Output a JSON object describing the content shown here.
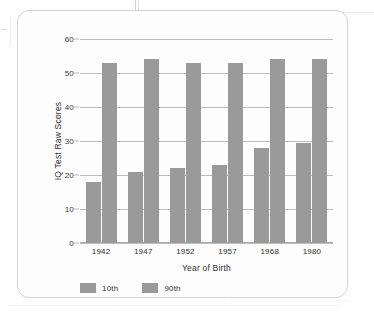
{
  "chart_data": {
    "type": "bar",
    "title": "",
    "xlabel": "Year of Birth",
    "ylabel": "IQ Test Raw Scores",
    "categories": [
      "1942",
      "1947",
      "1952",
      "1957",
      "1968",
      "1980"
    ],
    "series": [
      {
        "name": "10th",
        "values": [
          18,
          21,
          22,
          23,
          28,
          29.5
        ],
        "color": "#9a9a9a"
      },
      {
        "name": "90th",
        "values": [
          53,
          54,
          53,
          53,
          54,
          54
        ],
        "color": "#9a9a9a"
      }
    ],
    "ylim": [
      0,
      60
    ],
    "yticks": [
      "0",
      "10",
      "20",
      "30",
      "40",
      "50",
      "60"
    ],
    "ytick_values": [
      0,
      10,
      20,
      30,
      40,
      50,
      60
    ],
    "grid": true,
    "legend_position": "bottom-left",
    "legend": [
      "10th",
      "90th"
    ]
  },
  "axis": {
    "y_title": "IQ Test Raw Scores",
    "x_title": "Year of Birth"
  },
  "colors": {
    "bar": "#9a9a9a",
    "gridline": "#bcbcbc",
    "card_border": "#d3d3d3",
    "text": "#2e2e2e",
    "background": "#fefefe"
  }
}
